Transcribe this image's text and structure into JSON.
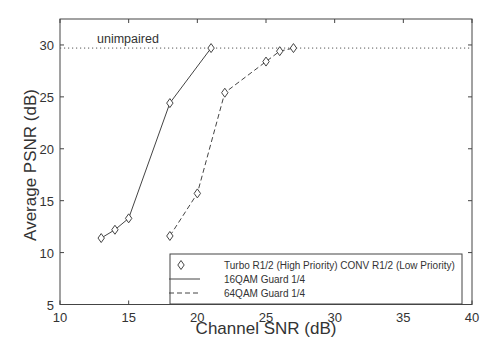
{
  "chart_data": {
    "type": "line",
    "title": "",
    "xlabel": "Channel SNR (dB)",
    "ylabel": "Average PSNR (dB)",
    "xlim": [
      10,
      40
    ],
    "ylim": [
      5,
      32.5
    ],
    "xticks": [
      10,
      15,
      20,
      25,
      30,
      35,
      40
    ],
    "yticks": [
      5,
      10,
      15,
      20,
      25,
      30
    ],
    "grid": false,
    "legend_position": "lower right",
    "legend": [
      "Turbo R1/2 (High Priority) CONV R1/2 (Low Priority)",
      "16QAM Guard 1/4",
      "64QAM Guard 1/4"
    ],
    "annotations": [
      {
        "text": "unimpaired",
        "y": 29.7,
        "style": "dotted horizontal line"
      }
    ],
    "series": [
      {
        "name": "16QAM Guard 1/4",
        "line_style": "solid",
        "marker": "diamond",
        "x": [
          13,
          14,
          15,
          18,
          21
        ],
        "y": [
          11.4,
          12.2,
          13.3,
          24.4,
          29.7
        ]
      },
      {
        "name": "64QAM Guard 1/4",
        "line_style": "dashed",
        "marker": "diamond",
        "x": [
          18,
          20,
          22,
          25,
          26,
          27
        ],
        "y": [
          11.6,
          15.7,
          25.4,
          28.4,
          29.4,
          29.7
        ]
      }
    ],
    "unimpaired_level": 29.7
  },
  "labels": {
    "xlabel": "Channel SNR (dB)",
    "ylabel": "Average PSNR (dB)",
    "unimpaired": "unimpaired",
    "legend_marker": "Turbo R1/2 (High Priority) CONV R1/2 (Low Priority)",
    "legend_solid": "16QAM Guard 1/4",
    "legend_dashed": "64QAM Guard 1/4"
  }
}
